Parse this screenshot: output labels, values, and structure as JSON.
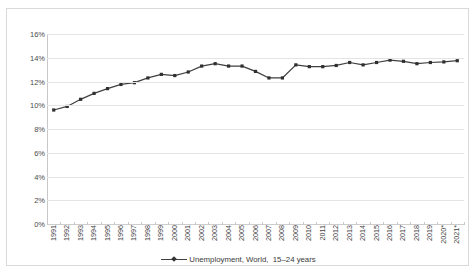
{
  "chart_data": {
    "type": "line",
    "title": "",
    "xlabel": "",
    "ylabel": "",
    "ylim": [
      0,
      16
    ],
    "ytick_labels": [
      "0%",
      "2%",
      "4%",
      "6%",
      "8%",
      "10%",
      "12%",
      "14%",
      "16%"
    ],
    "ytick_values": [
      0,
      2,
      4,
      6,
      8,
      10,
      12,
      14,
      16
    ],
    "grid": true,
    "legend_position": "bottom-center",
    "categories": [
      "1991",
      "1992",
      "1993",
      "1994",
      "1995",
      "1996",
      "1997",
      "1998",
      "1999",
      "2000",
      "2001",
      "2002",
      "2003",
      "2004",
      "2005",
      "2006",
      "2007",
      "2008",
      "2009",
      "2010",
      "2011",
      "2012",
      "2013",
      "2014",
      "2015",
      "2016",
      "2017",
      "2018",
      "2019",
      "2020*",
      "2021*"
    ],
    "series": [
      {
        "name": "Unemployment, World,  15–24 years",
        "color": "#404040",
        "marker": "square",
        "values": [
          9.6,
          9.9,
          10.5,
          11.0,
          11.4,
          11.75,
          11.9,
          12.3,
          12.6,
          12.5,
          12.8,
          13.3,
          13.5,
          13.3,
          13.3,
          12.85,
          12.3,
          12.3,
          13.4,
          13.25,
          13.25,
          13.35,
          13.6,
          13.4,
          13.6,
          13.8,
          13.7,
          13.5,
          13.6,
          13.65,
          13.75
        ]
      }
    ]
  },
  "legend": {
    "label": "Unemployment, World,  15–24 years"
  },
  "axes": {
    "y_labels": [
      "16%",
      "14%",
      "12%",
      "10%",
      "8%",
      "6%",
      "4%",
      "2%",
      "0%"
    ],
    "x_labels": [
      "1991",
      "1992",
      "1993",
      "1994",
      "1995",
      "1996",
      "1997",
      "1998",
      "1999",
      "2000",
      "2001",
      "2002",
      "2003",
      "2004",
      "2005",
      "2006",
      "2007",
      "2008",
      "2009",
      "2010",
      "2011",
      "2012",
      "2013",
      "2014",
      "2015",
      "2016",
      "2017",
      "2018",
      "2019",
      "2020*",
      "2021*"
    ]
  },
  "colors": {
    "line": "#404040",
    "marker": "#2f2f2f",
    "grid": "#e4e4e4",
    "border": "#d9d9d9",
    "text": "#3a3a3a"
  }
}
